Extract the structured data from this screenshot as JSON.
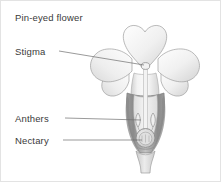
{
  "figure": {
    "title": "Pin-eyed flower"
  },
  "labels": [
    {
      "id": "stigma",
      "text": "Stigma"
    },
    {
      "id": "anthers",
      "text": "Anthers"
    },
    {
      "id": "nectary",
      "text": "Nectary"
    }
  ],
  "colors": {
    "text": "#3a3a3a",
    "leader_line": "#6e6e6e",
    "outline": "#9a9a9a",
    "petal_light": "#fdfdfd",
    "petal_shade": "#dcdcdc",
    "corolla_tube": "#e8e8e8",
    "calyx_dark": "#8d8d8d",
    "calyx_mid": "#b5b5b5",
    "ovary": "#c8c8c8",
    "background": "#ffffff",
    "border": "#e3e3e3"
  },
  "parts": [
    {
      "name": "petal-top",
      "label": "top petal lobe"
    },
    {
      "name": "petal-left",
      "label": "left petal lobe"
    },
    {
      "name": "petal-right",
      "label": "right petal lobe"
    },
    {
      "name": "petal-lower-left",
      "label": "lower left petal lobe"
    },
    {
      "name": "petal-lower-right",
      "label": "lower right petal lobe"
    },
    {
      "name": "corolla-tube",
      "label": "corolla tube"
    },
    {
      "name": "style",
      "label": "style"
    },
    {
      "name": "stigma",
      "label": "stigma"
    },
    {
      "name": "anther-left",
      "label": "left anther"
    },
    {
      "name": "anther-right",
      "label": "right anther"
    },
    {
      "name": "ovary",
      "label": "ovary with nectary"
    },
    {
      "name": "calyx",
      "label": "calyx"
    },
    {
      "name": "pedicel",
      "label": "pedicel"
    }
  ]
}
